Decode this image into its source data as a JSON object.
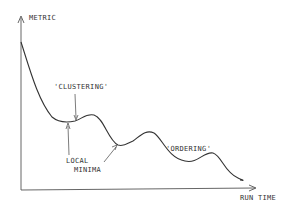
{
  "diagram": {
    "y_axis_label": "METRIC",
    "x_axis_label": "RUN TIME",
    "annotations": {
      "clustering": "'CLUSTERING'",
      "ordering": "'ORDERING'",
      "local_minima_line1": "LOCAL",
      "local_minima_line2": "MINIMA"
    },
    "colors": {
      "line": "#333333",
      "axis": "#555555",
      "background": "#ffffff"
    }
  }
}
